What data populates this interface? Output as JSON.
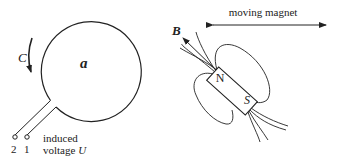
{
  "loop": {
    "label": "a",
    "direction_label": "C",
    "terminals": [
      "2",
      "1"
    ],
    "voltage_label_line1": "induced",
    "voltage_label_line2": "voltage ",
    "voltage_symbol": "U"
  },
  "magnet": {
    "north_label": "N",
    "south_label": "S",
    "field_label": "B",
    "motion_label": "moving magnet"
  },
  "colors": {
    "stroke": "#222222",
    "background": "#ffffff"
  }
}
